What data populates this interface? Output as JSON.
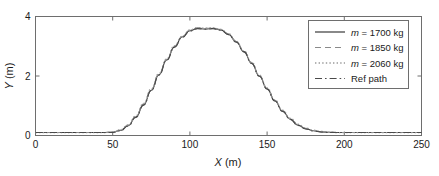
{
  "chart_data": {
    "type": "line",
    "title": "",
    "xlabel": "X (m)",
    "ylabel": "Y (m)",
    "xlim": [
      0,
      250
    ],
    "ylim": [
      0,
      4
    ],
    "xticks": [
      0,
      50,
      100,
      150,
      200,
      250
    ],
    "yticks": [
      0,
      2,
      4
    ],
    "xticklabels": [
      "0",
      "50",
      "100",
      "150",
      "200",
      "250"
    ],
    "yticklabels": [
      "0",
      "2",
      "4"
    ],
    "grid": false,
    "legend_position": "upper right",
    "x": [
      0,
      5,
      10,
      15,
      20,
      25,
      30,
      35,
      40,
      45,
      50,
      55,
      60,
      65,
      70,
      75,
      80,
      85,
      90,
      95,
      100,
      105,
      110,
      115,
      120,
      125,
      130,
      135,
      140,
      145,
      150,
      155,
      160,
      165,
      170,
      175,
      180,
      185,
      190,
      195,
      200,
      205,
      210,
      215,
      220,
      225,
      230,
      235,
      240,
      245,
      250
    ],
    "series": [
      {
        "name": "m = 1700 kg",
        "label_math": "m",
        "label_value": "= 1700 kg",
        "style": "solid",
        "color": "#3a3a3a",
        "values": [
          0.1,
          0.1,
          0.1,
          0.1,
          0.1,
          0.1,
          0.1,
          0.1,
          0.1,
          0.1,
          0.11,
          0.17,
          0.33,
          0.62,
          1.03,
          1.52,
          2.04,
          2.54,
          2.98,
          3.31,
          3.52,
          3.6,
          3.58,
          3.6,
          3.55,
          3.4,
          3.15,
          2.82,
          2.43,
          2.0,
          1.57,
          1.17,
          0.82,
          0.55,
          0.35,
          0.23,
          0.16,
          0.12,
          0.11,
          0.1,
          0.1,
          0.1,
          0.1,
          0.1,
          0.1,
          0.1,
          0.1,
          0.1,
          0.1,
          0.1,
          0.1
        ]
      },
      {
        "name": "m = 1850 kg",
        "label_math": "m",
        "label_value": "= 1850 kg",
        "style": "dashed",
        "color": "#8a8a8a",
        "values": [
          0.1,
          0.1,
          0.1,
          0.1,
          0.1,
          0.1,
          0.1,
          0.1,
          0.1,
          0.1,
          0.11,
          0.18,
          0.35,
          0.64,
          1.06,
          1.55,
          2.07,
          2.56,
          3.0,
          3.33,
          3.54,
          3.62,
          3.6,
          3.61,
          3.56,
          3.41,
          3.16,
          2.83,
          2.44,
          2.01,
          1.58,
          1.18,
          0.83,
          0.56,
          0.36,
          0.24,
          0.17,
          0.13,
          0.11,
          0.1,
          0.1,
          0.1,
          0.1,
          0.1,
          0.1,
          0.1,
          0.1,
          0.1,
          0.1,
          0.1,
          0.1
        ]
      },
      {
        "name": "m = 2060 kg",
        "label_math": "m",
        "label_value": "= 2060 kg",
        "style": "dotted",
        "color": "#9a9a9a",
        "values": [
          0.1,
          0.1,
          0.1,
          0.1,
          0.1,
          0.1,
          0.1,
          0.1,
          0.1,
          0.1,
          0.11,
          0.19,
          0.36,
          0.66,
          1.08,
          1.57,
          2.09,
          2.58,
          3.02,
          3.34,
          3.55,
          3.63,
          3.61,
          3.62,
          3.57,
          3.42,
          3.17,
          2.84,
          2.46,
          2.03,
          1.6,
          1.2,
          0.85,
          0.58,
          0.38,
          0.25,
          0.18,
          0.14,
          0.11,
          0.1,
          0.1,
          0.1,
          0.1,
          0.1,
          0.1,
          0.1,
          0.1,
          0.1,
          0.1,
          0.1,
          0.1
        ]
      },
      {
        "name": "Ref path",
        "label_math": "",
        "label_value": "Ref path",
        "style": "dashdot",
        "color": "#4a4a4a",
        "values": [
          0.1,
          0.1,
          0.1,
          0.1,
          0.1,
          0.1,
          0.1,
          0.1,
          0.1,
          0.1,
          0.1,
          0.16,
          0.32,
          0.61,
          1.02,
          1.51,
          2.03,
          2.53,
          2.97,
          3.3,
          3.51,
          3.59,
          3.57,
          3.59,
          3.54,
          3.39,
          3.14,
          2.81,
          2.42,
          1.99,
          1.56,
          1.16,
          0.81,
          0.54,
          0.34,
          0.22,
          0.15,
          0.12,
          0.1,
          0.1,
          0.1,
          0.1,
          0.1,
          0.1,
          0.1,
          0.1,
          0.1,
          0.1,
          0.1,
          0.1,
          0.1
        ]
      }
    ],
    "legend": [
      {
        "label": "m = 1700 kg",
        "math": "m",
        "rest": "= 1700 kg",
        "style": "solid"
      },
      {
        "label": "m = 1850 kg",
        "math": "m",
        "rest": "= 1850 kg",
        "style": "dashed"
      },
      {
        "label": "m = 2060 kg",
        "math": "m",
        "rest": "= 2060 kg",
        "style": "dotted"
      },
      {
        "label": "Ref path",
        "math": "",
        "rest": "Ref path",
        "style": "dashdot"
      }
    ],
    "axis_label_x_var": "X",
    "axis_label_x_unit": "(m)",
    "axis_label_y_var": "Y",
    "axis_label_y_unit": "(m)"
  }
}
